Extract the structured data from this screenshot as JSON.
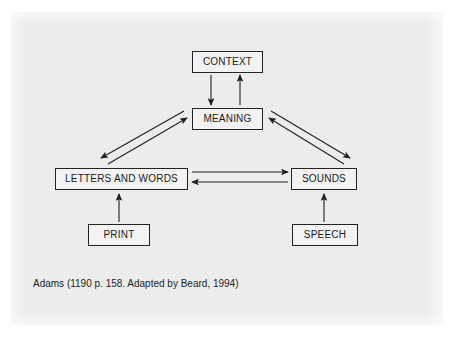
{
  "figure": {
    "caption": "Adams (1190 p. 158. Adapted by Beard, 1994)",
    "panel_color": "#ececec",
    "background_color": "#ffffff",
    "box_fill_color": "#f2f2f2",
    "box_border_color": "#232323",
    "text_color": "#1a1a1a"
  },
  "nodes": [
    {
      "id": "context",
      "label": "CONTEXT",
      "x": 192,
      "y": 51,
      "width": 71,
      "height": 22
    },
    {
      "id": "meaning",
      "label": "MEANING",
      "x": 192,
      "y": 108,
      "width": 71,
      "height": 22
    },
    {
      "id": "letters_and_words",
      "label": "LETTERS AND WORDS",
      "x": 55,
      "y": 168,
      "width": 133,
      "height": 22
    },
    {
      "id": "sounds",
      "label": "SOUNDS",
      "x": 291,
      "y": 168,
      "width": 66,
      "height": 22
    },
    {
      "id": "print",
      "label": "PRINT",
      "x": 88,
      "y": 224,
      "width": 62,
      "height": 22
    },
    {
      "id": "speech",
      "label": "SPEECH",
      "x": 292,
      "y": 224,
      "width": 66,
      "height": 22
    }
  ],
  "edges": [
    {
      "id": "context-to-meaning",
      "from": "context",
      "to": "meaning",
      "direction": "down",
      "x1": 211,
      "y1": 75,
      "x2": 211,
      "y2": 105
    },
    {
      "id": "meaning-to-context",
      "from": "meaning",
      "to": "context",
      "direction": "up",
      "x1": 240,
      "y1": 105,
      "x2": 240,
      "y2": 75
    },
    {
      "id": "letters-to-meaning",
      "from": "letters_and_words",
      "to": "meaning",
      "direction": "up-right",
      "x1": 108,
      "y1": 164,
      "x2": 187,
      "y2": 118
    },
    {
      "id": "meaning-to-letters",
      "from": "meaning",
      "to": "letters_and_words",
      "direction": "down-left",
      "x1": 184,
      "y1": 111,
      "x2": 101,
      "y2": 158
    },
    {
      "id": "sounds-to-meaning",
      "from": "sounds",
      "to": "meaning",
      "direction": "up-left",
      "x1": 344,
      "y1": 164,
      "x2": 269,
      "y2": 118
    },
    {
      "id": "meaning-to-sounds",
      "from": "meaning",
      "to": "sounds",
      "direction": "down-right",
      "x1": 271,
      "y1": 111,
      "x2": 350,
      "y2": 158
    },
    {
      "id": "letters-to-sounds",
      "from": "letters_and_words",
      "to": "sounds",
      "direction": "right",
      "x1": 192,
      "y1": 172,
      "x2": 288,
      "y2": 172
    },
    {
      "id": "sounds-to-letters",
      "from": "sounds",
      "to": "letters_and_words",
      "direction": "left",
      "x1": 288,
      "y1": 182,
      "x2": 192,
      "y2": 182
    },
    {
      "id": "print-to-letters",
      "from": "print",
      "to": "letters_and_words",
      "direction": "up",
      "x1": 119,
      "y1": 222,
      "x2": 119,
      "y2": 194
    },
    {
      "id": "speech-to-sounds",
      "from": "speech",
      "to": "sounds",
      "direction": "up",
      "x1": 324,
      "y1": 222,
      "x2": 324,
      "y2": 194
    }
  ]
}
